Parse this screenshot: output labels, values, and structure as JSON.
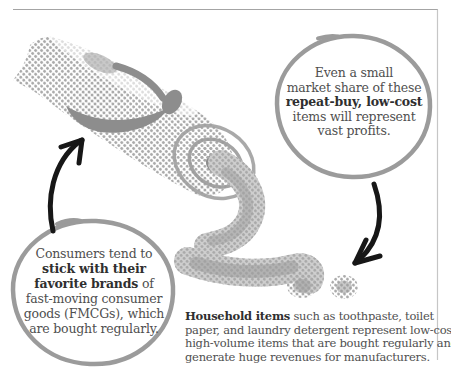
{
  "page": {
    "background": "#ffffff",
    "top_border_color": "#a4a4a4",
    "right_border_color": "#c6c6c6"
  },
  "colors": {
    "circle_stroke": "#9b9b9b",
    "arrow": "#171717",
    "text_regular": "#4f4f4f",
    "text_bold": "#2f2f2f",
    "halftone_dot": "#a9a9a9",
    "swoosh": "#8d8d8d"
  },
  "illustration": {
    "subject": "toothpaste tube squeezing paste in halftone print style",
    "elements": [
      "toothpaste-tube",
      "tube-swoosh-graphic",
      "tube-cap-rings",
      "squeezed-paste",
      "paste-blob",
      "paste-dot"
    ]
  },
  "bubble_right": {
    "line1": "Even a small",
    "line2": "market share of these",
    "line3_bold": "repeat-buy, low-cost",
    "line4": "items will represent",
    "line5": "vast profits."
  },
  "bubble_left": {
    "line1": "Consumers tend to",
    "line2_bold": "stick with their",
    "line3_bold": "favorite brands",
    "line3_rest": " of",
    "line4": "fast-moving consumer",
    "line5": "goods (FMCGs), which",
    "line6": "are bought regularly."
  },
  "caption": {
    "line1_bold": "Household items",
    "line1_rest": " such as toothpaste, toilet",
    "line2": "paper, and laundry detergent represent low-cost,",
    "line3": "high-volume items that are bought regularly and",
    "line4": "generate huge revenues for manufacturers."
  }
}
